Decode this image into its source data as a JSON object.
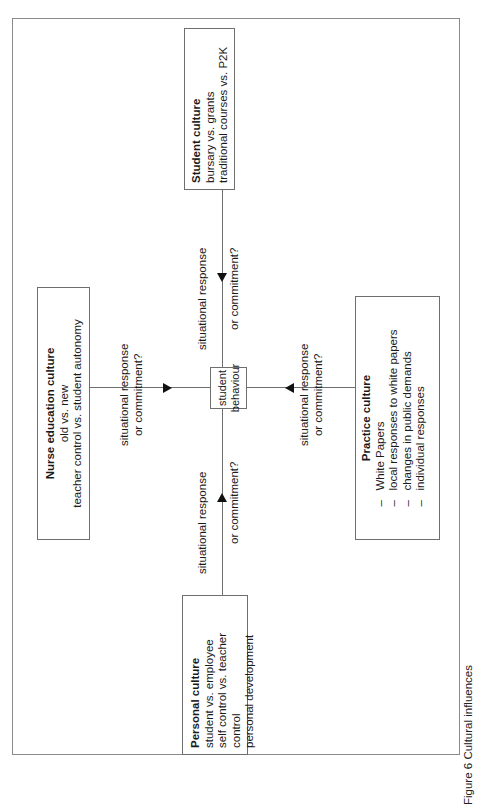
{
  "figure": {
    "caption": "Figure 6 Cultural influences",
    "center": {
      "label_line1": "student",
      "label_line2": "behaviour"
    },
    "nodes": {
      "student_culture": {
        "title": "Student culture",
        "lines": [
          "bursary vs. grants",
          "traditional courses vs. P2K"
        ]
      },
      "nurse_education_culture": {
        "title": "Nurse education culture",
        "lines": [
          "old vs. new",
          "teacher control vs. student autonomy"
        ]
      },
      "practice_culture": {
        "title": "Practice culture",
        "items": [
          "White Papers",
          "local responses to white papers",
          "changes in public demands",
          "individual responses"
        ]
      },
      "personal_culture": {
        "title": "Personal culture",
        "lines": [
          "student vs. employee",
          "self control vs. teacher control",
          "personal development"
        ]
      }
    },
    "edges": {
      "student_to_center": {
        "line1": "situational response",
        "line2": "or commitment?"
      },
      "nurse_to_center": {
        "line1": "situational response",
        "line2": "or commitment?"
      },
      "practice_to_center": {
        "line1": "situational response",
        "line2": "or commitment?"
      },
      "personal_to_center": {
        "line1": "situational response",
        "line2": "or commitment?"
      }
    },
    "colors": {
      "line": "#6f6f6f",
      "frame": "#8a8a8a",
      "text": "#1a1a1a",
      "background": "#ffffff"
    }
  }
}
